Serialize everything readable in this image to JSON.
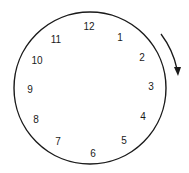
{
  "diagram": {
    "type": "clock-face",
    "numbers": [
      {
        "label": "12",
        "x": 89,
        "y": 27
      },
      {
        "label": "1",
        "x": 120,
        "y": 38
      },
      {
        "label": "2",
        "x": 142,
        "y": 58
      },
      {
        "label": "3",
        "x": 151,
        "y": 87
      },
      {
        "label": "4",
        "x": 143,
        "y": 117
      },
      {
        "label": "5",
        "x": 124,
        "y": 141
      },
      {
        "label": "6",
        "x": 93,
        "y": 154
      },
      {
        "label": "7",
        "x": 58,
        "y": 142
      },
      {
        "label": "8",
        "x": 36,
        "y": 120
      },
      {
        "label": "9",
        "x": 30,
        "y": 90
      },
      {
        "label": "10",
        "x": 37,
        "y": 61
      },
      {
        "label": "11",
        "x": 56,
        "y": 40
      }
    ],
    "arrow": {
      "direction": "clockwise",
      "icon": "clockwise-arrow-icon"
    },
    "colors": {
      "stroke": "#1a1a1a",
      "background": "#ffffff"
    }
  }
}
